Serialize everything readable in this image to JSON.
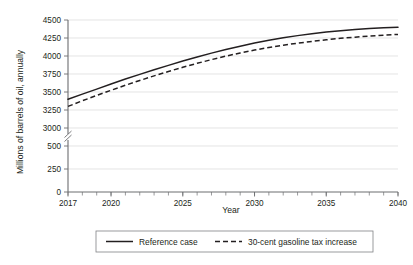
{
  "chart_data": {
    "type": "line",
    "title": "",
    "xlabel": "Year",
    "ylabel": "Millions of barrels of oil, annually",
    "xlim": [
      2017,
      2040
    ],
    "ylim": [
      0,
      4500
    ],
    "grid": true,
    "axis_break": {
      "present": true,
      "between": [
        500,
        3000
      ],
      "note": "y-axis broken between 500 and 3000"
    },
    "y_ticks": [
      0,
      250,
      500,
      3000,
      3250,
      3500,
      3750,
      4000,
      4250,
      4500
    ],
    "y_tick_labels": [
      "0",
      "250",
      "500",
      "3000",
      "3250",
      "3500",
      "3750",
      "4000",
      "4250",
      "4500"
    ],
    "x_ticks": [
      2017,
      2020,
      2025,
      2030,
      2035,
      2040
    ],
    "x_tick_labels": [
      "2017",
      "2020",
      "2025",
      "2030",
      "2035",
      "2040"
    ],
    "x_minor_tick_step": 1,
    "legend_position": "bottom",
    "x": [
      2017,
      2018,
      2019,
      2020,
      2021,
      2022,
      2023,
      2024,
      2025,
      2026,
      2027,
      2028,
      2029,
      2030,
      2031,
      2032,
      2033,
      2034,
      2035,
      2036,
      2037,
      2038,
      2039,
      2040
    ],
    "series": [
      {
        "name": "Reference case",
        "style": "solid",
        "color": "#231f20",
        "values": [
          3400,
          3470,
          3540,
          3610,
          3680,
          3745,
          3810,
          3870,
          3930,
          3985,
          4040,
          4090,
          4135,
          4180,
          4218,
          4252,
          4283,
          4310,
          4333,
          4352,
          4368,
          4382,
          4392,
          4400
        ]
      },
      {
        "name": "30-cent gasoline tax increase",
        "style": "dashed",
        "color": "#231f20",
        "values": [
          3300,
          3378,
          3452,
          3524,
          3594,
          3660,
          3724,
          3785,
          3843,
          3898,
          3950,
          3998,
          4042,
          4082,
          4118,
          4150,
          4178,
          4203,
          4225,
          4245,
          4262,
          4277,
          4290,
          4300
        ]
      }
    ]
  },
  "legend": {
    "entries": [
      {
        "label": "Reference case",
        "style": "solid"
      },
      {
        "label": "30-cent gasoline tax increase",
        "style": "dashed"
      }
    ]
  },
  "axes": {
    "x_title": "Year",
    "y_title": "Millions of barrels of oil, annually"
  }
}
